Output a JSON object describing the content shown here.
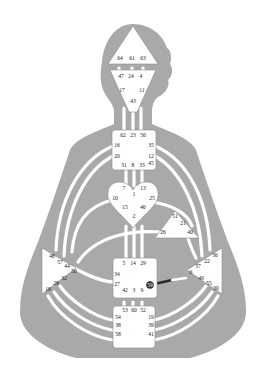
{
  "colors": {
    "background": "#ffffff",
    "silhouette": "#a9a9a9",
    "center_fill": "#ffffff",
    "center_outline": "#8a8a8a",
    "channel_open": "#ffffff",
    "channel_defined": "#2a2a2a",
    "gate_defined": "#2a2a2a"
  },
  "centers": {
    "head": {
      "gates": [
        "64",
        "61",
        "63"
      ]
    },
    "ajna": {
      "gates": [
        "47",
        "24",
        "4",
        "17",
        "11",
        "43"
      ]
    },
    "throat": {
      "gates": [
        "62",
        "23",
        "56",
        "16",
        "35",
        "20",
        "12",
        "45",
        "31",
        "8",
        "33"
      ]
    },
    "g": {
      "gates": [
        "7",
        "1",
        "13",
        "10",
        "25",
        "15",
        "46",
        "2"
      ]
    },
    "ego": {
      "gates": [
        "51",
        "21",
        "26",
        "40"
      ]
    },
    "spleen": {
      "gates": [
        "48",
        "57",
        "44",
        "50",
        "32",
        "28",
        "18"
      ]
    },
    "sacral": {
      "gates": [
        "5",
        "14",
        "29",
        "34",
        "27",
        "42",
        "3",
        "9",
        "59"
      ]
    },
    "solar_plexus": {
      "gates": [
        "36",
        "22",
        "37",
        "6",
        "49",
        "55",
        "30"
      ]
    },
    "root": {
      "gates": [
        "53",
        "60",
        "52",
        "54",
        "19",
        "38",
        "39",
        "58",
        "41"
      ]
    }
  },
  "defined": {
    "gates": [
      "59"
    ],
    "channels": [
      [
        "59",
        "6"
      ]
    ]
  }
}
